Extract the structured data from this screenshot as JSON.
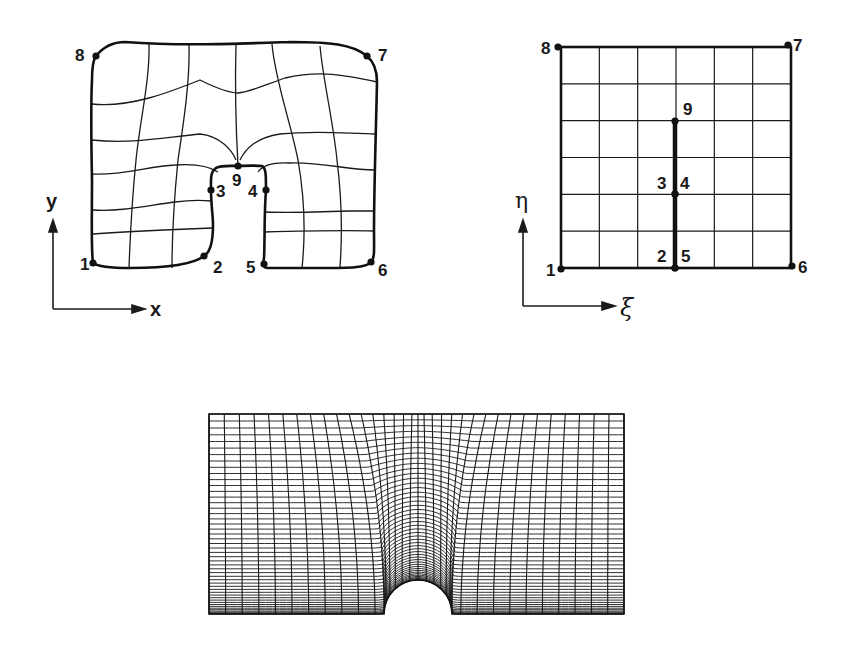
{
  "figure": {
    "physical_domain": {
      "axes": {
        "x_label": "x",
        "y_label": "y"
      },
      "points": [
        {
          "id": "1",
          "label": "1",
          "x": 93,
          "y": 263,
          "lx": 80,
          "ly": 270
        },
        {
          "id": "2",
          "label": "2",
          "x": 204,
          "y": 256,
          "lx": 213,
          "ly": 273
        },
        {
          "id": "3",
          "label": "3",
          "x": 211,
          "y": 190,
          "lx": 216,
          "ly": 197
        },
        {
          "id": "4",
          "label": "4",
          "x": 266,
          "y": 190,
          "lx": 248,
          "ly": 197
        },
        {
          "id": "5",
          "label": "5",
          "x": 264,
          "y": 264,
          "lx": 246,
          "ly": 273
        },
        {
          "id": "6",
          "label": "6",
          "x": 371,
          "y": 262,
          "lx": 378,
          "ly": 276
        },
        {
          "id": "7",
          "label": "7",
          "x": 367,
          "y": 56,
          "lx": 378,
          "ly": 61
        },
        {
          "id": "8",
          "label": "8",
          "x": 96,
          "y": 56,
          "lx": 75,
          "ly": 61
        },
        {
          "id": "9",
          "label": "9",
          "x": 238,
          "y": 166,
          "lx": 232,
          "ly": 186
        }
      ]
    },
    "computational_domain": {
      "axes": {
        "xi_label": "ξ",
        "eta_label": "η"
      },
      "grid": {
        "x0": 561,
        "y0": 47,
        "x1": 791,
        "y1": 268,
        "cols": 6,
        "rows": 6
      },
      "cut": {
        "x": 675,
        "y_top": 121,
        "y_bottom": 268
      },
      "points": [
        {
          "id": "1",
          "label": "1",
          "x": 561,
          "y": 269,
          "lx": 546,
          "ly": 276
        },
        {
          "id": "2",
          "label": "2",
          "x": 675,
          "y": 268,
          "lx": 657,
          "ly": 262
        },
        {
          "id": "3",
          "label": "3",
          "x": 675,
          "y": 194,
          "lx": 657,
          "ly": 189
        },
        {
          "id": "4",
          "label": "4",
          "x": 675,
          "y": 194,
          "lx": 680,
          "ly": 189
        },
        {
          "id": "5",
          "label": "5",
          "x": 675,
          "y": 268,
          "lx": 681,
          "ly": 262
        },
        {
          "id": "6",
          "label": "6",
          "x": 792,
          "y": 266,
          "lx": 798,
          "ly": 273
        },
        {
          "id": "7",
          "label": "7",
          "x": 788,
          "y": 45,
          "lx": 793,
          "ly": 51
        },
        {
          "id": "8",
          "label": "8",
          "x": 558,
          "y": 47,
          "lx": 541,
          "ly": 54
        },
        {
          "id": "9",
          "label": "9",
          "x": 675,
          "y": 121,
          "lx": 683,
          "ly": 115
        }
      ]
    },
    "generated_mesh": {
      "x0": 209,
      "y0": 414,
      "x1": 624,
      "y1": 614,
      "hole_cx": 418,
      "hole_r": 34,
      "columns": 34,
      "rows": 48
    }
  }
}
